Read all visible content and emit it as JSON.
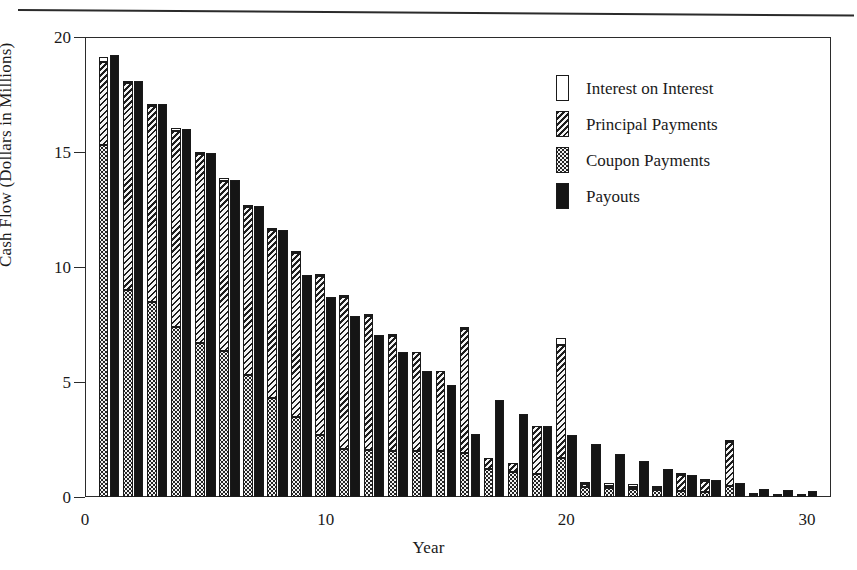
{
  "figure": {
    "x_axis_title": "Year",
    "y_axis_title": "Cash Flow (Dollars in Millions)"
  },
  "legend": {
    "items": [
      {
        "label": "Interest on Interest",
        "pattern": "white",
        "color": "#ffffff"
      },
      {
        "label": "Principal Payments",
        "pattern": "hatch",
        "color": "#efefef"
      },
      {
        "label": "Coupon Payments",
        "pattern": "dot",
        "color": "#f2f2f2"
      },
      {
        "label": "Payouts",
        "pattern": "payout",
        "color": "#151515"
      }
    ]
  },
  "chart_data": {
    "type": "bar",
    "title": "",
    "subtitle": "",
    "xlabel": "Year",
    "ylabel": "Cash Flow (Dollars in Millions)",
    "xlim": [
      0,
      31
    ],
    "ylim": [
      0,
      20
    ],
    "yticks": [
      0,
      5,
      10,
      15,
      20
    ],
    "ytick_labels": [
      "0",
      "5",
      "10",
      "15",
      "20"
    ],
    "xticks": [
      0,
      10,
      20,
      30
    ],
    "xtick_labels": [
      "0",
      "10",
      "20",
      "30"
    ],
    "grid": false,
    "legend_position": "upper right",
    "bar_mode": "paired-stacked",
    "x": [
      1,
      2,
      3,
      4,
      5,
      6,
      7,
      8,
      9,
      10,
      11,
      12,
      13,
      14,
      15,
      16,
      17,
      18,
      19,
      20,
      21,
      22,
      23,
      24,
      25,
      26,
      27,
      28,
      29,
      30
    ],
    "series": [
      {
        "name": "Coupon Payments",
        "pattern": "dot",
        "stack": "inflow",
        "values": [
          15.3,
          9.0,
          8.5,
          7.4,
          6.7,
          6.35,
          5.3,
          4.3,
          3.5,
          2.7,
          2.1,
          2.05,
          2.0,
          2.0,
          2.0,
          1.9,
          1.2,
          1.1,
          1.0,
          1.7,
          0.45,
          0.4,
          0.35,
          0.3,
          0.25,
          0.2,
          0.5,
          0.1,
          0.05,
          0.05
        ]
      },
      {
        "name": "Principal Payments",
        "pattern": "hatch",
        "stack": "inflow",
        "values": [
          3.6,
          9.0,
          8.5,
          8.5,
          8.2,
          7.4,
          7.3,
          7.3,
          7.1,
          6.9,
          6.6,
          5.8,
          5.0,
          4.3,
          3.5,
          5.4,
          0.5,
          0.4,
          2.1,
          4.9,
          0.1,
          0.1,
          0.1,
          0.1,
          0.7,
          0.5,
          1.9,
          0.0,
          0.0,
          0.0
        ]
      },
      {
        "name": "Interest on Interest",
        "pattern": "white",
        "stack": "inflow",
        "values": [
          0.25,
          0.1,
          0.05,
          0.15,
          0.1,
          0.1,
          0.05,
          0.05,
          0.05,
          0.05,
          0.05,
          0.05,
          0.05,
          0.0,
          0.0,
          0.1,
          0.0,
          0.0,
          0.0,
          0.3,
          0.1,
          0.1,
          0.1,
          0.05,
          0.05,
          0.05,
          0.05,
          0.05,
          0.05,
          0.05
        ]
      },
      {
        "name": "Payouts",
        "pattern": "payout",
        "stack": "payout",
        "values": [
          19.2,
          18.1,
          17.1,
          16.0,
          14.95,
          13.8,
          12.65,
          11.6,
          9.65,
          8.7,
          7.85,
          7.05,
          6.3,
          5.5,
          4.85,
          2.75,
          4.2,
          3.6,
          3.1,
          2.7,
          2.3,
          1.85,
          1.55,
          1.2,
          0.95,
          0.75,
          0.6,
          0.35,
          0.3,
          0.25
        ]
      }
    ],
    "inflow_totals": [
      19.15,
      18.1,
      17.05,
      16.05,
      15.0,
      13.85,
      12.65,
      11.65,
      10.65,
      9.65,
      8.75,
      7.9,
      7.05,
      6.3,
      5.5,
      7.4,
      1.7,
      1.5,
      3.1,
      6.9,
      0.65,
      0.6,
      0.55,
      0.45,
      1.0,
      0.75,
      2.45,
      0.15,
      0.1,
      0.1
    ]
  }
}
